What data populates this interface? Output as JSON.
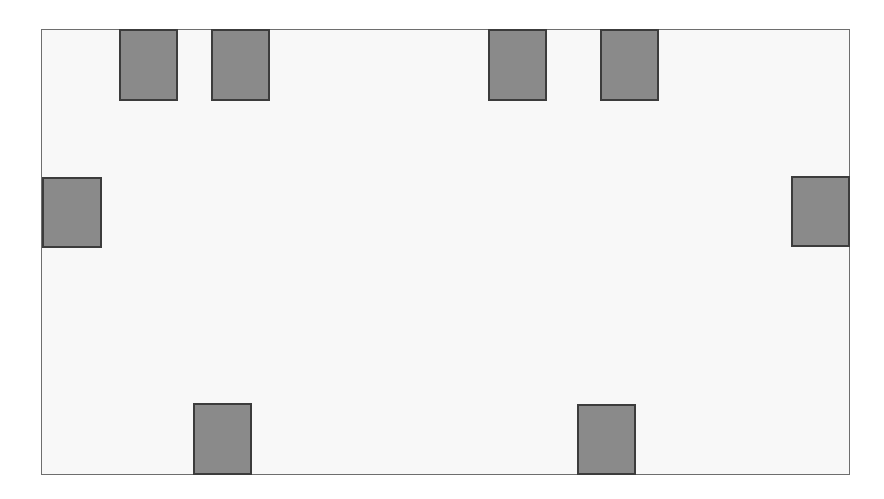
{
  "diagram": {
    "outer_rect": {
      "x": 41,
      "y": 29,
      "w": 809,
      "h": 446,
      "fill": "#f8f8f8",
      "stroke": "#6e6e6e"
    },
    "block_style": {
      "fill": "#8a8a8a",
      "stroke": "#3c3c3c"
    },
    "blocks": [
      {
        "id": "top-1",
        "side": "top",
        "x": 119,
        "y": 29,
        "w": 59,
        "h": 72
      },
      {
        "id": "top-2",
        "side": "top",
        "x": 211,
        "y": 29,
        "w": 59,
        "h": 72
      },
      {
        "id": "top-3",
        "side": "top",
        "x": 488,
        "y": 29,
        "w": 59,
        "h": 72
      },
      {
        "id": "top-4",
        "side": "top",
        "x": 600,
        "y": 29,
        "w": 59,
        "h": 72
      },
      {
        "id": "left-1",
        "side": "left",
        "x": 42,
        "y": 177,
        "w": 60,
        "h": 71
      },
      {
        "id": "right-1",
        "side": "right",
        "x": 791,
        "y": 176,
        "w": 59,
        "h": 71
      },
      {
        "id": "bottom-1",
        "side": "bottom",
        "x": 193,
        "y": 403,
        "w": 59,
        "h": 72
      },
      {
        "id": "bottom-2",
        "side": "bottom",
        "x": 577,
        "y": 404,
        "w": 59,
        "h": 71
      }
    ]
  }
}
